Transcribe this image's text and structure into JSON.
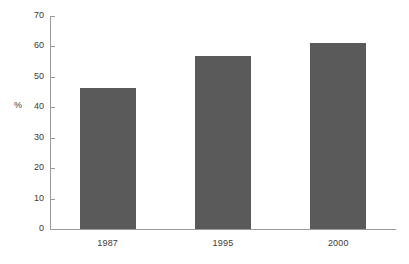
{
  "chart_data": {
    "type": "bar",
    "title": "",
    "subtitle": "",
    "xlabel": "",
    "ylabel": "%",
    "categories": [
      "1987",
      "1995",
      "2000"
    ],
    "values": [
      46.5,
      57,
      61
    ],
    "series": [
      {
        "name": "",
        "values": [
          46.5,
          57,
          61
        ]
      }
    ],
    "ylim": [
      0,
      70
    ],
    "yticks": [
      0,
      10,
      20,
      30,
      40,
      50,
      60,
      70
    ],
    "ytick_labels": [
      "0",
      "10",
      "20",
      "30",
      "40",
      "50",
      "60",
      "70"
    ],
    "grid": false,
    "legend": null,
    "legend_position": "none",
    "annotations": [],
    "colors": {
      "bar_fill": "#5a5a5a",
      "axis": "#9a9a9a",
      "text": "#3a3a3a",
      "background": "#ffffff"
    }
  }
}
